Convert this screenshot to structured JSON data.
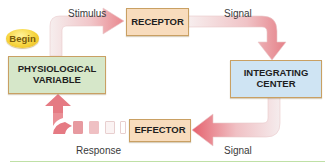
{
  "diagram": {
    "start_badge": {
      "label": "Begin",
      "color": "#f6d43e"
    },
    "nodes": [
      {
        "id": "physiological-variable",
        "label": "PHYSIOLOGICAL\nVARIABLE",
        "fill": "#d6e7c9",
        "border": "#c9a063"
      },
      {
        "id": "receptor",
        "label": "RECEPTOR",
        "fill": "#f8dcbd",
        "border": "#c9a063"
      },
      {
        "id": "integrating-center",
        "label": "INTEGRATING\nCENTER",
        "fill": "#cfe4f3",
        "border": "#c9a063"
      },
      {
        "id": "effector",
        "label": "EFFECTOR",
        "fill": "#f8dcbd",
        "border": "#c9a063"
      }
    ],
    "edges": [
      {
        "from": "physiological-variable",
        "to": "receptor",
        "label": "Stimulus"
      },
      {
        "from": "receptor",
        "to": "integrating-center",
        "label": "Signal"
      },
      {
        "from": "integrating-center",
        "to": "effector",
        "label": "Signal"
      },
      {
        "from": "effector",
        "to": "physiological-variable",
        "label": "Response"
      }
    ],
    "arrow_color": "#e8707a",
    "accent_line_color": "#bfe0a6"
  }
}
